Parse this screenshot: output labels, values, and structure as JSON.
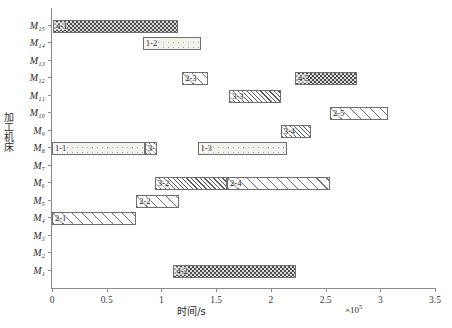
{
  "chart_data": {
    "type": "bar",
    "chart_kind": "gantt",
    "title": "",
    "xlabel": "时间/s",
    "ylabel": "加工机床",
    "x_exponent": "×10",
    "x_exponent_power": "5",
    "xlim": [
      0,
      3.5
    ],
    "xticks": [
      0,
      0.5,
      1,
      1.5,
      2,
      2.5,
      3,
      3.5
    ],
    "xticklabels": [
      "0",
      "0.5",
      "1",
      "1.5",
      "2",
      "2.5",
      "3",
      "3.5"
    ],
    "grid": false,
    "legend": "none",
    "categories": [
      "M15",
      "M14",
      "M13",
      "M12",
      "M11",
      "M10",
      "M9",
      "M8",
      "M7",
      "M6",
      "M5",
      "M4",
      "M3",
      "M2",
      "M1"
    ],
    "yticklabels": [
      "M₁₅",
      "M₁₄",
      "M₁₃",
      "M₁₂",
      "M₁₁",
      "M₁₀",
      "M₉",
      "M₈",
      "M₇",
      "M₆",
      "M₅",
      "M₄",
      "M₃",
      "M₂",
      "M₁"
    ],
    "tasks": [
      {
        "machine": "M15",
        "label": "4-1",
        "start": 0.01,
        "end": 1.15,
        "pattern": "check"
      },
      {
        "machine": "M14",
        "label": "1-2",
        "start": 0.83,
        "end": 1.36,
        "pattern": "dots"
      },
      {
        "machine": "M12",
        "label": "2-3",
        "start": 1.19,
        "end": 1.43,
        "pattern": "hatch"
      },
      {
        "machine": "M12",
        "label": "4-3",
        "start": 2.22,
        "end": 2.79,
        "pattern": "check"
      },
      {
        "machine": "M11",
        "label": "3-3",
        "start": 1.62,
        "end": 2.09,
        "pattern": "hatch-dense"
      },
      {
        "machine": "M10",
        "label": "2-5",
        "start": 2.54,
        "end": 3.07,
        "pattern": "hatch"
      },
      {
        "machine": "M9",
        "label": "3-4",
        "start": 2.09,
        "end": 2.37,
        "pattern": "hatch-dense"
      },
      {
        "machine": "M8",
        "label": "1-1",
        "start": 0.0,
        "end": 0.85,
        "pattern": "dots"
      },
      {
        "machine": "M8",
        "label": "3-1",
        "start": 0.85,
        "end": 0.96,
        "pattern": "hatch-dense"
      },
      {
        "machine": "M8",
        "label": "1-3",
        "start": 1.33,
        "end": 2.15,
        "pattern": "dots"
      },
      {
        "machine": "M6",
        "label": "3-2",
        "start": 0.94,
        "end": 1.6,
        "pattern": "hatch-dense"
      },
      {
        "machine": "M6",
        "label": "2-4",
        "start": 1.6,
        "end": 2.54,
        "pattern": "hatch"
      },
      {
        "machine": "M5",
        "label": "2-2",
        "start": 0.77,
        "end": 1.16,
        "pattern": "hatch"
      },
      {
        "machine": "M4",
        "label": "2-1",
        "start": 0.0,
        "end": 0.77,
        "pattern": "hatch"
      },
      {
        "machine": "M1",
        "label": "4-2",
        "start": 1.11,
        "end": 2.23,
        "pattern": "check"
      }
    ]
  }
}
